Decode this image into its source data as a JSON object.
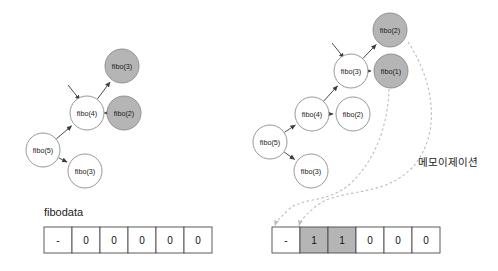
{
  "figure": {
    "colors": {
      "node_white_fill": "#ffffff",
      "node_gray_fill": "#b5b5b5",
      "node_stroke": "#8a8a8a",
      "edge": "#4a4a4a",
      "dashed_arrow": "#bdbdbd",
      "text": "#1a1a1a",
      "background": "#ffffff"
    }
  },
  "left_panel": {
    "nodes": [
      {
        "id": "l-fibo5",
        "label": "fibo(5)",
        "state": "white",
        "cx": 43,
        "cy": 150,
        "r": 17
      },
      {
        "id": "l-fibo4",
        "label": "fibo(4)",
        "state": "white",
        "cx": 87,
        "cy": 113,
        "r": 17
      },
      {
        "id": "l-fibo3b",
        "label": "fibo(3)",
        "state": "white",
        "cx": 85,
        "cy": 171,
        "r": 17
      },
      {
        "id": "l-fibo3a",
        "label": "fibo(3)",
        "state": "gray",
        "cx": 122,
        "cy": 66,
        "r": 17
      },
      {
        "id": "l-fibo2",
        "label": "fibo(2)",
        "state": "gray",
        "cx": 124,
        "cy": 113,
        "r": 17
      }
    ],
    "edges": [
      {
        "from": "l-fibo5",
        "to": "l-fibo4"
      },
      {
        "from": "l-fibo5",
        "to": "l-fibo3b"
      },
      {
        "from": "l-fibo4",
        "to": "l-fibo3a"
      },
      {
        "from": "l-fibo4",
        "to": "l-fibo2"
      }
    ],
    "pointer_arrow": {
      "x1": 68,
      "y1": 85,
      "x2": 80,
      "y2": 100
    },
    "table": {
      "label": "fibodata",
      "label_x": 44,
      "label_y": 216,
      "x": 44,
      "y": 227,
      "cell_width": 28,
      "cell_height": 26,
      "cells": [
        {
          "value": "-",
          "filled": false
        },
        {
          "value": "0",
          "filled": false
        },
        {
          "value": "0",
          "filled": false
        },
        {
          "value": "0",
          "filled": false
        },
        {
          "value": "0",
          "filled": false
        },
        {
          "value": "0",
          "filled": false
        }
      ]
    }
  },
  "right_panel": {
    "nodes": [
      {
        "id": "r-fibo5",
        "label": "fibo(5)",
        "state": "white",
        "cx": 270,
        "cy": 142,
        "r": 17
      },
      {
        "id": "r-fibo4",
        "label": "fibo(4)",
        "state": "white",
        "cx": 312,
        "cy": 114,
        "r": 17
      },
      {
        "id": "r-fibo3c",
        "label": "fibo(3)",
        "state": "white",
        "cx": 311,
        "cy": 171,
        "r": 17
      },
      {
        "id": "r-fibo2b",
        "label": "fibo(2)",
        "state": "white",
        "cx": 353,
        "cy": 114,
        "r": 17
      },
      {
        "id": "r-fibo3a",
        "label": "fibo(3)",
        "state": "white",
        "cx": 351,
        "cy": 71,
        "r": 17
      },
      {
        "id": "r-fibo2a",
        "label": "fibo(2)",
        "state": "gray",
        "cx": 390,
        "cy": 30,
        "r": 17
      },
      {
        "id": "r-fibo1",
        "label": "fibo(1)",
        "state": "gray",
        "cx": 391,
        "cy": 71,
        "r": 17
      }
    ],
    "edges": [
      {
        "from": "r-fibo5",
        "to": "r-fibo4"
      },
      {
        "from": "r-fibo5",
        "to": "r-fibo3c"
      },
      {
        "from": "r-fibo4",
        "to": "r-fibo2b"
      },
      {
        "from": "r-fibo4",
        "to": "r-fibo3a"
      },
      {
        "from": "r-fibo3a",
        "to": "r-fibo2a"
      },
      {
        "from": "r-fibo3a",
        "to": "r-fibo1"
      }
    ],
    "pointer_arrow": {
      "x1": 332,
      "y1": 43,
      "x2": 344,
      "y2": 58
    },
    "annotation": {
      "text": "메모이제이션",
      "x": 418,
      "y": 166
    },
    "memo_arrows": [
      {
        "from_node": "r-fibo2a",
        "to_cell": 1,
        "path": "M 408 42 C 432 78 444 132 412 168 C 380 200 338 186 314 208 C 302 218 300 222 299 226"
      },
      {
        "from_node": "r-fibo1",
        "to_cell": 2,
        "path": "M 389 89 C 388 124 376 160 350 184 C 328 204 300 196 286 212 C 278 220 276 222 275 226"
      }
    ],
    "table": {
      "x": 272,
      "y": 227,
      "cell_width": 28,
      "cell_height": 26,
      "cells": [
        {
          "value": "-",
          "filled": false
        },
        {
          "value": "1",
          "filled": true
        },
        {
          "value": "1",
          "filled": true
        },
        {
          "value": "0",
          "filled": false
        },
        {
          "value": "0",
          "filled": false
        },
        {
          "value": "0",
          "filled": false
        }
      ]
    }
  }
}
